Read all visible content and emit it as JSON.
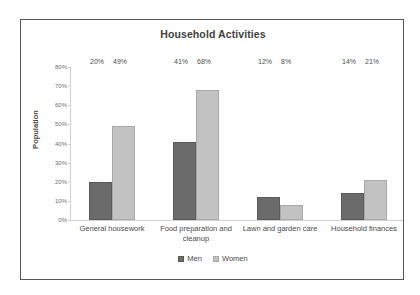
{
  "chart_data": {
    "type": "bar",
    "title": "Household Activities",
    "xlabel": "",
    "ylabel": "Population",
    "ylim": [
      0,
      80
    ],
    "ytick_labels": [
      "80%",
      "70%",
      "60%",
      "50%",
      "40%",
      "30%",
      "20%",
      "10%",
      "0%"
    ],
    "ytick_values": [
      80,
      70,
      60,
      50,
      40,
      30,
      20,
      10,
      0
    ],
    "grid": false,
    "legend_position": "bottom",
    "categories": [
      "General housework",
      "Food preparation and cleanup",
      "Lawn and garden care",
      "Household finances"
    ],
    "series": [
      {
        "name": "Men",
        "color": "#6b6b6b",
        "values": [
          20,
          41,
          12,
          14
        ],
        "labels": [
          "20%",
          "41%",
          "12%",
          "14%"
        ]
      },
      {
        "name": "Women",
        "color": "#c2c2c2",
        "values": [
          49,
          68,
          8,
          21
        ],
        "labels": [
          "49%",
          "68%",
          "8%",
          "21%"
        ]
      }
    ]
  }
}
